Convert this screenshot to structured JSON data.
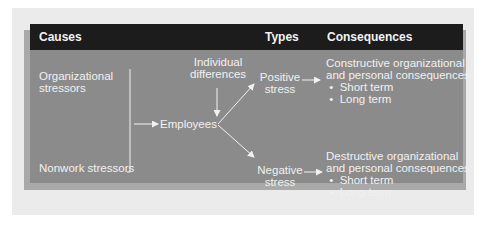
{
  "header": {
    "causes": "Causes",
    "types": "Types",
    "consequences": "Consequences"
  },
  "causes": {
    "organizational_line1": "Organizational",
    "organizational_line2": "stressors",
    "nonwork": "Nonwork stressors"
  },
  "center": {
    "individual_line1": "Individual",
    "individual_line2": "differences",
    "employees": "Employees"
  },
  "types": {
    "positive_line1": "Positive",
    "positive_line2": "stress",
    "negative_line1": "Negative",
    "negative_line2": "stress"
  },
  "consequences": {
    "positive": {
      "line1": "Constructive organizational",
      "line2": "and personal consequences",
      "bullets": [
        "Short term",
        "Long term"
      ]
    },
    "negative": {
      "line1": "Destructive organizational",
      "line2": "and personal consequences",
      "bullets": [
        "Short term",
        "Long term"
      ]
    }
  },
  "colors": {
    "header_bg": "#1c1c1c",
    "panel_bg": "#8b8b8b",
    "text": "#f1f1f1",
    "frame_bg": "#ebebeb"
  }
}
